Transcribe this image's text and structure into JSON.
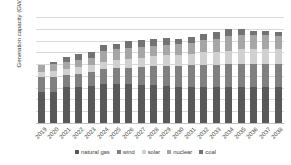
{
  "chart_data": {
    "type": "bar",
    "stacked": true,
    "title": "",
    "xlabel": "",
    "ylabel": "Generation capacity (GW)",
    "ylim": [
      0,
      180
    ],
    "ytick_step": 20,
    "yticks": [
      180,
      160,
      140,
      120,
      100,
      80,
      60,
      40,
      20,
      0
    ],
    "grid": true,
    "legend_position": "bottom",
    "categories": [
      "2019",
      "2020",
      "2021",
      "2022",
      "2023",
      "2024",
      "2025",
      "2026",
      "2027",
      "2028",
      "2029",
      "2030",
      "2031",
      "2032",
      "2033",
      "2034",
      "2035",
      "2036",
      "2037",
      "2038"
    ],
    "series": [
      {
        "name": "natural gas",
        "color": "#595959",
        "values": [
          53,
          53,
          62,
          62,
          63,
          67,
          67,
          66,
          65,
          64,
          63,
          61,
          61,
          61,
          61,
          61,
          61,
          61,
          61,
          61
        ]
      },
      {
        "name": "wind",
        "color": "#808080",
        "values": [
          26,
          26,
          19,
          22,
          23,
          24,
          26,
          28,
          30,
          32,
          34,
          36,
          37,
          38,
          38,
          39,
          40,
          40,
          40,
          40
        ]
      },
      {
        "name": "solar",
        "color": "#d0d0d0",
        "values": [
          8,
          9,
          10,
          11,
          12,
          13,
          14,
          15,
          16,
          17,
          18,
          19,
          20,
          21,
          22,
          23,
          24,
          24,
          24,
          24
        ]
      },
      {
        "name": "nuclear",
        "color": "#a6a6a6",
        "values": [
          12,
          12,
          12,
          12,
          12,
          18,
          18,
          18,
          18,
          18,
          18,
          18,
          18,
          21,
          21,
          24,
          24,
          24,
          24,
          23
        ]
      },
      {
        "name": "coal",
        "color": "#737373",
        "values": [
          0,
          3,
          9,
          10,
          10,
          10,
          10,
          12,
          12,
          12,
          12,
          9,
          10,
          10,
          13,
          12,
          11,
          8,
          7,
          7
        ]
      }
    ],
    "totals": [
      99,
      103,
      112,
      117,
      120,
      132,
      135,
      139,
      141,
      143,
      145,
      143,
      146,
      151,
      155,
      159,
      160,
      157,
      156,
      155
    ],
    "legend": [
      "natural gas",
      "wind",
      "solar",
      "nuclear",
      "coal"
    ]
  }
}
